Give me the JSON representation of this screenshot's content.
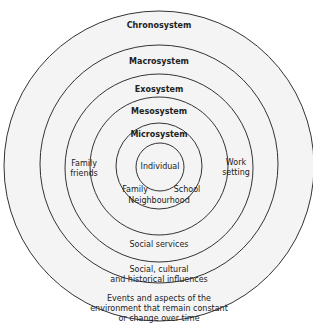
{
  "diagram": {
    "type": "concentric-circles",
    "fill_color": "#f4f4f4",
    "stroke_color": "#333333",
    "rings": [
      {
        "name": "Chronosystem",
        "description": "Events and aspects of the environment that remain constant or change over time",
        "desc_lines": [
          "Events and aspects of the",
          "environment that remain constant",
          "or change over time"
        ]
      },
      {
        "name": "Macrosystem",
        "description": "Social, cultural and historical influences",
        "desc_lines": [
          "Social, cultural",
          "and historical influences"
        ]
      },
      {
        "name": "Exosystem",
        "description": "Social services",
        "desc_lines": [
          "Social services"
        ]
      },
      {
        "name": "Mesosystem",
        "side_left": [
          "Family",
          "friends"
        ],
        "side_right": [
          "Work",
          "setting"
        ]
      },
      {
        "name": "Microsystem",
        "items": [
          "Family",
          "School",
          "Neighbourhood"
        ]
      },
      {
        "name": "Individual"
      }
    ]
  }
}
